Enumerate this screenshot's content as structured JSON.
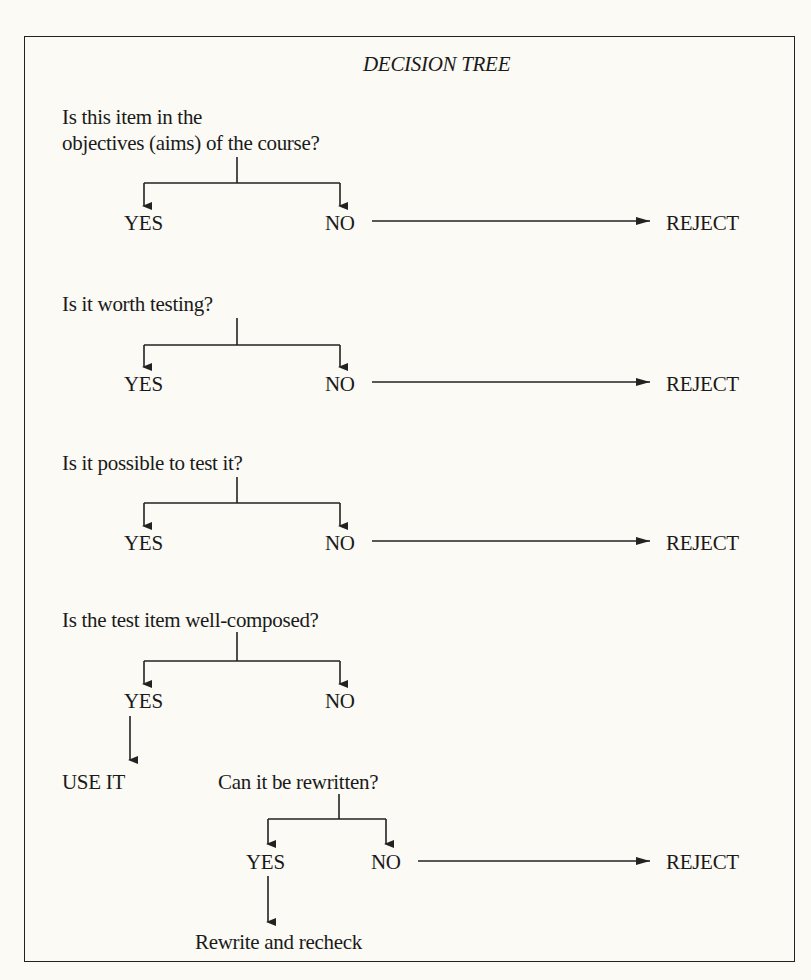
{
  "title": "DECISION TREE",
  "questions": [
    {
      "line1": "Is this item in the",
      "line2": "objectives (aims) of the course?"
    },
    {
      "line1": "Is it worth testing?"
    },
    {
      "line1": "Is it possible to test it?"
    },
    {
      "line1": "Is the test item well-composed?"
    },
    {
      "line1": "Can it be rewritten?"
    }
  ],
  "labels": {
    "yes": "YES",
    "no": "NO",
    "reject": "REJECT",
    "use_it": "USE IT",
    "rewrite": "Rewrite and recheck"
  }
}
